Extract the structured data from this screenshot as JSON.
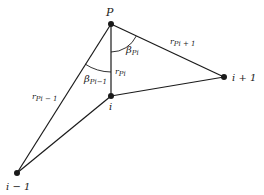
{
  "diagram": {
    "points": {
      "P": {
        "label": "P",
        "x": 111,
        "y": 24
      },
      "i": {
        "label": "i",
        "x": 111,
        "y": 96
      },
      "i_minus_1": {
        "label": "i − 1",
        "x": 17,
        "y": 173
      },
      "i_plus_1": {
        "label": "i + 1",
        "x": 224,
        "y": 77
      }
    },
    "edges": [
      {
        "from": "P",
        "to": "i",
        "label_main": "r",
        "label_sub": "Pi"
      },
      {
        "from": "P",
        "to": "i_plus_1",
        "label_main": "r",
        "label_sub": "Pi + 1"
      },
      {
        "from": "P",
        "to": "i_minus_1",
        "label_main": "r",
        "label_sub": "Pi − 1"
      },
      {
        "from": "i",
        "to": "i_plus_1"
      },
      {
        "from": "i",
        "to": "i_minus_1"
      }
    ],
    "angles": {
      "beta_Pi": {
        "main": "β",
        "sub": "Pi"
      },
      "beta_Pi_minus_1": {
        "main": "β",
        "sub": "Pi−1"
      }
    },
    "colors": {
      "line": "#1a1a1a",
      "background": "#ffffff"
    }
  }
}
